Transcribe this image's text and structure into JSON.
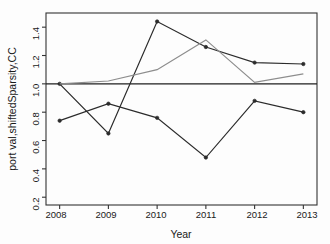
{
  "chart_data": {
    "type": "line",
    "title": "",
    "xlabel": "Year",
    "ylabel": "port val,shiftedSparsity,CC",
    "x": [
      2008,
      2009,
      2010,
      2011,
      2012,
      2013
    ],
    "xtick_labels": [
      "2008",
      "2009",
      "2010",
      "2011",
      "2012",
      "2013"
    ],
    "ytick_labels": [
      "0.2",
      "0.4",
      "0.6",
      "0.8",
      "1.0",
      "1.2",
      "1.4"
    ],
    "ytick_values": [
      0.2,
      0.4,
      0.6,
      0.8,
      1.0,
      1.2,
      1.4
    ],
    "xlim": [
      2007.72,
      2013.28
    ],
    "ylim": [
      0.145,
      1.5
    ],
    "grid": false,
    "legend": false,
    "legend_position": "none",
    "series": [
      {
        "name": "series-upper-dark",
        "color": "#2b2b2b",
        "markers": true,
        "values": [
          1.0,
          0.65,
          1.44,
          1.26,
          1.15,
          1.14
        ]
      },
      {
        "name": "series-gray",
        "color": "#8d8d8d",
        "markers": false,
        "values": [
          1.0,
          1.02,
          1.1,
          1.31,
          1.01,
          1.07
        ]
      },
      {
        "name": "series-lower-dark",
        "color": "#2b2b2b",
        "markers": true,
        "values": [
          0.74,
          0.86,
          0.76,
          0.48,
          0.88,
          0.8
        ]
      }
    ],
    "annotations": [
      {
        "name": "reference-line",
        "type": "hline",
        "value": 1.0,
        "color": "#1f1f1f"
      }
    ]
  }
}
